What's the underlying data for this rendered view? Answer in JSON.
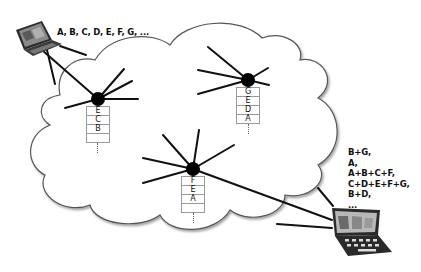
{
  "diagram": {
    "type": "network",
    "cloud": {
      "label": "network",
      "stroke": "#555555",
      "fill": "#ffffff"
    },
    "source": {
      "name": "source-laptop",
      "packets_label": "A, B, C, D, E, F, G, ..."
    },
    "receiver": {
      "name": "receiver-laptop",
      "received_lines": [
        "B+G,",
        "A,",
        "A+B+C+F,",
        "C+D+E+F+G,",
        "B+D,",
        "..."
      ]
    },
    "nodes": [
      {
        "id": "node-left",
        "buffer": [
          "E",
          "C",
          "B",
          ""
        ],
        "more": "⋮"
      },
      {
        "id": "node-right",
        "buffer": [
          "G",
          "E",
          "D",
          "A"
        ],
        "more": "⋮"
      },
      {
        "id": "node-center",
        "buffer": [
          "F",
          "E",
          "A",
          ""
        ],
        "more": "⋮"
      }
    ],
    "colors": {
      "line": "#111111",
      "node": "#000000",
      "buffer_border": "#9a9a9a"
    }
  }
}
